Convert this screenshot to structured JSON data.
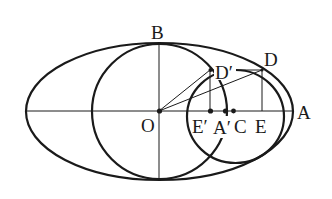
{
  "figure": {
    "type": "geometry-diagram",
    "labels": {
      "B": "B",
      "D": "D",
      "D_prime": "D′",
      "O": "O",
      "E_prime": "E′",
      "A_prime": "A′",
      "C": "C",
      "E": "E",
      "A": "A"
    },
    "colors": {
      "ink": "#1a1a1a",
      "background": "#ffffff"
    }
  }
}
